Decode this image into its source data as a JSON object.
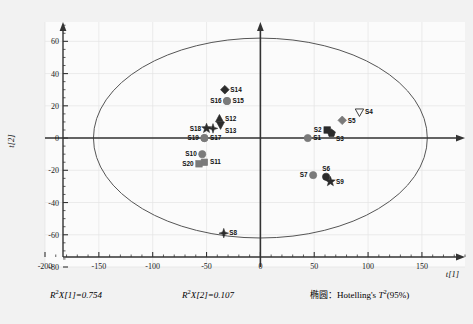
{
  "axes": {
    "x_title": "t[1]",
    "y_title": "t[2]",
    "x_ticks": [
      "-200",
      "-150",
      "-100",
      "-50",
      "0",
      "50",
      "100",
      "150"
    ],
    "x_tick_values": [
      -200,
      -150,
      -100,
      -50,
      0,
      50,
      100,
      150
    ],
    "y_ticks": [
      "-80",
      "-60",
      "-40",
      "-20",
      "0",
      "20",
      "40",
      "60"
    ],
    "y_tick_values": [
      -80,
      -60,
      -40,
      -20,
      0,
      20,
      40,
      60
    ]
  },
  "footer": {
    "r2x1": "R2X[1]=0.754",
    "r2x1_base": "R",
    "r2x1_sup": "2",
    "r2x1_rest": "X[1]=0.754",
    "r2x2_base": "R",
    "r2x2_sup": "2",
    "r2x2_rest": "X[2]=0.107",
    "ellipse_note_cn": "椭圆：",
    "ellipse_note_en": "Hotelling's ",
    "ellipse_note_t": "T",
    "ellipse_note_sup": "2",
    "ellipse_note_pct": "(95%)"
  },
  "colors": {
    "background": "#f2f2f2",
    "plot_area": "#fbfbfb",
    "axis": "#333333",
    "ellipse": "#555555",
    "marker_gray": "#7a7a7a",
    "marker_dark": "#2b2b2b",
    "grid": "#e4e4e4"
  },
  "chart_data": {
    "type": "scatter",
    "title": "",
    "xlabel": "t[1]",
    "ylabel": "t[2]",
    "xlim": [
      -200,
      190
    ],
    "ylim": [
      -80,
      72
    ],
    "grid": false,
    "legend": "none",
    "ellipse": {
      "name": "Hotelling's T2 (95%)",
      "center_x": 0,
      "center_y": 0,
      "semi_axis_x": 155,
      "semi_axis_y": 62
    },
    "points": [
      {
        "label": "S1",
        "x": 44,
        "y": 0,
        "marker": "circle",
        "fill": "gray",
        "label_pos": "right"
      },
      {
        "label": "S2",
        "x": 62,
        "y": 5,
        "marker": "square",
        "fill": "dark",
        "label_pos": "left"
      },
      {
        "label": "S3",
        "x": 66,
        "y": 3,
        "marker": "pentagon",
        "fill": "dark",
        "label_pos": "below-right"
      },
      {
        "label": "S4",
        "x": 92,
        "y": 16,
        "marker": "triangle-down-open",
        "fill": "none",
        "label_pos": "right"
      },
      {
        "label": "S5",
        "x": 76,
        "y": 11,
        "marker": "diamond",
        "fill": "gray",
        "label_pos": "right"
      },
      {
        "label": "S6",
        "x": 61,
        "y": -24,
        "marker": "circle",
        "fill": "dark",
        "label_pos": "above"
      },
      {
        "label": "S7",
        "x": 49,
        "y": -23,
        "marker": "circle",
        "fill": "gray",
        "label_pos": "left"
      },
      {
        "label": "S8",
        "x": -34,
        "y": -59,
        "marker": "star4",
        "fill": "dark",
        "label_pos": "right"
      },
      {
        "label": "S9",
        "x": 65,
        "y": -27,
        "marker": "star5",
        "fill": "dark",
        "label_pos": "right"
      },
      {
        "label": "S10",
        "x": -54,
        "y": -10,
        "marker": "circle",
        "fill": "gray",
        "label_pos": "left"
      },
      {
        "label": "S11",
        "x": -52,
        "y": -15,
        "marker": "square",
        "fill": "gray",
        "label_pos": "right"
      },
      {
        "label": "S12",
        "x": -38,
        "y": 12,
        "marker": "triangle-up",
        "fill": "dark",
        "label_pos": "right"
      },
      {
        "label": "S13",
        "x": -37,
        "y": 8,
        "marker": "triangle-down",
        "fill": "dark",
        "label_pos": "below-right"
      },
      {
        "label": "S14",
        "x": -33,
        "y": 30,
        "marker": "diamond",
        "fill": "dark",
        "label_pos": "right"
      },
      {
        "label": "S15",
        "x": -31,
        "y": 23,
        "marker": "circle",
        "fill": "gray",
        "label_pos": "right"
      },
      {
        "label": "S16",
        "x": -31,
        "y": 23,
        "marker": "circle",
        "fill": "gray",
        "label_pos": "left"
      },
      {
        "label": "S17",
        "x": -52,
        "y": 0,
        "marker": "circle",
        "fill": "gray",
        "label_pos": "right"
      },
      {
        "label": "S18",
        "x": -50,
        "y": 6,
        "marker": "star5",
        "fill": "dark",
        "label_pos": "left"
      },
      {
        "label": "S19",
        "x": -52,
        "y": 0,
        "marker": "circle",
        "fill": "gray",
        "label_pos": "left"
      },
      {
        "label": "S20",
        "x": -57,
        "y": -16,
        "marker": "square",
        "fill": "gray",
        "label_pos": "left"
      },
      {
        "label": "S17b",
        "x": -44,
        "y": 6,
        "marker": "star4",
        "fill": "dark",
        "label_pos": "none"
      }
    ]
  }
}
